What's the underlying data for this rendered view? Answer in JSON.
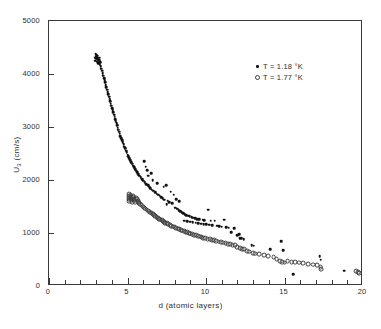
{
  "figure": {
    "background": "#ffffff",
    "frame_color": "#3a3a3a",
    "marker_filled_color": "#111111",
    "marker_open_color": "#3d3d3d"
  },
  "axes": {
    "x_title": "d (atomic layers)",
    "y_title_main": "U",
    "y_title_sub": "3",
    "y_title_unit": " (cm/s)",
    "x_ticks": [
      "0",
      "5",
      "10",
      "15",
      "20"
    ],
    "y_ticks": [
      "0",
      "1000",
      "2000",
      "3000",
      "4000",
      "5000"
    ]
  },
  "legend": {
    "items": [
      {
        "marker": "filled-dot",
        "label": "T = 1.18 °K"
      },
      {
        "marker": "open-circle",
        "label": "T = 1.77 °K"
      }
    ]
  },
  "chart_data": {
    "type": "scatter",
    "title": "",
    "xlabel": "d (atomic layers)",
    "ylabel": "U3 (cm/s)",
    "xlim": [
      0,
      20
    ],
    "ylim": [
      0,
      5000
    ],
    "xticks": [
      0,
      5,
      10,
      15,
      20
    ],
    "yticks": [
      0,
      1000,
      2000,
      3000,
      4000,
      5000
    ],
    "x_minor_tick_step": 1,
    "grid": false,
    "legend_position": "upper-right",
    "series": [
      {
        "name": "T = 1.18 °K",
        "marker": "filled-dot",
        "color": "#111111",
        "points": [
          [
            2.92,
            4310
          ],
          [
            2.95,
            4250
          ],
          [
            2.98,
            4375
          ],
          [
            3.0,
            4330
          ],
          [
            3.02,
            4290
          ],
          [
            3.04,
            4360
          ],
          [
            3.06,
            4230
          ],
          [
            3.08,
            4300
          ],
          [
            3.1,
            4345
          ],
          [
            3.12,
            4270
          ],
          [
            3.15,
            4200
          ],
          [
            3.18,
            4255
          ],
          [
            3.2,
            4310
          ],
          [
            3.23,
            4180
          ],
          [
            3.26,
            4220
          ],
          [
            3.3,
            4150
          ],
          [
            3.34,
            4100
          ],
          [
            3.38,
            4060
          ],
          [
            3.42,
            4010
          ],
          [
            3.46,
            3970
          ],
          [
            3.5,
            3920
          ],
          [
            3.54,
            3880
          ],
          [
            3.58,
            3840
          ],
          [
            3.62,
            3790
          ],
          [
            3.66,
            3750
          ],
          [
            3.7,
            3700
          ],
          [
            3.74,
            3660
          ],
          [
            3.78,
            3620
          ],
          [
            3.82,
            3570
          ],
          [
            3.86,
            3530
          ],
          [
            3.9,
            3490
          ],
          [
            3.94,
            3440
          ],
          [
            3.98,
            3400
          ],
          [
            4.02,
            3360
          ],
          [
            4.06,
            3320
          ],
          [
            4.1,
            3275
          ],
          [
            4.14,
            3235
          ],
          [
            4.18,
            3195
          ],
          [
            4.22,
            3150
          ],
          [
            4.26,
            3110
          ],
          [
            4.3,
            3070
          ],
          [
            4.34,
            3030
          ],
          [
            4.38,
            2990
          ],
          [
            4.42,
            2950
          ],
          [
            4.46,
            2910
          ],
          [
            4.5,
            2870
          ],
          [
            4.55,
            2830
          ],
          [
            4.6,
            2790
          ],
          [
            4.65,
            2750
          ],
          [
            4.7,
            2710
          ],
          [
            4.75,
            2670
          ],
          [
            4.8,
            2630
          ],
          [
            4.85,
            2595
          ],
          [
            4.9,
            2555
          ],
          [
            4.95,
            2520
          ],
          [
            5.0,
            2480
          ],
          [
            5.06,
            2445
          ],
          [
            5.12,
            2410
          ],
          [
            5.18,
            2375
          ],
          [
            5.24,
            2340
          ],
          [
            5.3,
            2305
          ],
          [
            5.36,
            2270
          ],
          [
            5.42,
            2240
          ],
          [
            5.48,
            2205
          ],
          [
            5.54,
            2175
          ],
          [
            5.6,
            2145
          ],
          [
            5.68,
            2110
          ],
          [
            5.76,
            2080
          ],
          [
            5.84,
            2050
          ],
          [
            5.92,
            2020
          ],
          [
            6.0,
            1990
          ],
          [
            6.05,
            2360
          ],
          [
            6.15,
            2250
          ],
          [
            6.25,
            2180
          ],
          [
            6.3,
            2080
          ],
          [
            6.1,
            1955
          ],
          [
            6.2,
            1925
          ],
          [
            6.3,
            1900
          ],
          [
            6.4,
            1875
          ],
          [
            6.5,
            2130
          ],
          [
            6.45,
            1845
          ],
          [
            6.55,
            1820
          ],
          [
            6.65,
            1795
          ],
          [
            6.75,
            1770
          ],
          [
            6.6,
            2000
          ],
          [
            6.85,
            1745
          ],
          [
            6.95,
            1720
          ],
          [
            7.05,
            1700
          ],
          [
            7.15,
            1680
          ],
          [
            6.9,
            1940
          ],
          [
            7.25,
            1655
          ],
          [
            7.35,
            1630
          ],
          [
            7.45,
            1900
          ],
          [
            7.55,
            1610
          ],
          [
            7.3,
            1870
          ],
          [
            7.5,
            1540
          ],
          [
            7.65,
            1585
          ],
          [
            7.75,
            1780
          ],
          [
            7.85,
            1560
          ],
          [
            7.95,
            1725
          ],
          [
            8.05,
            1480
          ],
          [
            8.15,
            1455
          ],
          [
            8.25,
            1430
          ],
          [
            8.35,
            1410
          ],
          [
            8.1,
            1640
          ],
          [
            8.45,
            1390
          ],
          [
            8.55,
            1370
          ],
          [
            8.3,
            1600
          ],
          [
            8.65,
            1355
          ],
          [
            8.75,
            1340
          ],
          [
            8.85,
            1325
          ],
          [
            8.95,
            1315
          ],
          [
            8.6,
            1235
          ],
          [
            8.8,
            1225
          ],
          [
            9.0,
            1215
          ],
          [
            9.1,
            1300
          ],
          [
            9.2,
            1290
          ],
          [
            9.3,
            1275
          ],
          [
            9.15,
            1205
          ],
          [
            9.35,
            1195
          ],
          [
            9.45,
            1265
          ],
          [
            9.55,
            1255
          ],
          [
            9.5,
            1185
          ],
          [
            9.7,
            1178
          ],
          [
            9.8,
            1250
          ],
          [
            9.9,
            1240
          ],
          [
            9.85,
            1170
          ],
          [
            10.0,
            1165
          ],
          [
            10.15,
            1440
          ],
          [
            10.3,
            1235
          ],
          [
            10.2,
            1155
          ],
          [
            10.4,
            1148
          ],
          [
            10.55,
            1230
          ],
          [
            10.7,
            1140
          ],
          [
            10.85,
            1130
          ],
          [
            11.0,
            1120
          ],
          [
            11.15,
            1250
          ],
          [
            11.3,
            1110
          ],
          [
            11.45,
            1100
          ],
          [
            11.6,
            1010
          ],
          [
            11.8,
            1090
          ],
          [
            12.0,
            960
          ],
          [
            12.1,
            975
          ],
          [
            12.15,
            905
          ],
          [
            12.25,
            900
          ],
          [
            12.4,
            880
          ],
          [
            12.9,
            770
          ],
          [
            13.05,
            760
          ],
          [
            14.1,
            690
          ],
          [
            14.8,
            845
          ],
          [
            14.9,
            680
          ],
          [
            15.55,
            225
          ],
          [
            17.25,
            560
          ],
          [
            17.3,
            500
          ],
          [
            18.8,
            290
          ]
        ]
      },
      {
        "name": "T = 1.77 °K",
        "marker": "open-circle",
        "color": "#3d3d3d",
        "points": [
          [
            5.08,
            1735
          ],
          [
            5.08,
            1700
          ],
          [
            5.08,
            1665
          ],
          [
            5.08,
            1630
          ],
          [
            5.08,
            1600
          ],
          [
            5.2,
            1715
          ],
          [
            5.22,
            1680
          ],
          [
            5.24,
            1650
          ],
          [
            5.26,
            1620
          ],
          [
            5.28,
            1590
          ],
          [
            5.35,
            1700
          ],
          [
            5.38,
            1670
          ],
          [
            5.41,
            1640
          ],
          [
            5.44,
            1610
          ],
          [
            5.47,
            1580
          ],
          [
            5.55,
            1660
          ],
          [
            5.6,
            1635
          ],
          [
            5.65,
            1610
          ],
          [
            5.7,
            1585
          ],
          [
            5.75,
            1560
          ],
          [
            5.82,
            1540
          ],
          [
            5.9,
            1520
          ],
          [
            5.98,
            1500
          ],
          [
            6.06,
            1480
          ],
          [
            6.14,
            1460
          ],
          [
            6.22,
            1440
          ],
          [
            6.3,
            1422
          ],
          [
            6.38,
            1404
          ],
          [
            6.46,
            1386
          ],
          [
            6.54,
            1368
          ],
          [
            6.62,
            1350
          ],
          [
            6.7,
            1333
          ],
          [
            6.78,
            1316
          ],
          [
            6.86,
            1300
          ],
          [
            6.94,
            1284
          ],
          [
            7.02,
            1268
          ],
          [
            7.1,
            1252
          ],
          [
            7.18,
            1237
          ],
          [
            7.26,
            1222
          ],
          [
            7.34,
            1208
          ],
          [
            7.42,
            1194
          ],
          [
            7.5,
            1180
          ],
          [
            7.6,
            1165
          ],
          [
            7.7,
            1150
          ],
          [
            7.8,
            1136
          ],
          [
            7.9,
            1122
          ],
          [
            8.0,
            1108
          ],
          [
            8.1,
            1095
          ],
          [
            8.2,
            1082
          ],
          [
            8.3,
            1069
          ],
          [
            8.4,
            1057
          ],
          [
            8.5,
            1045
          ],
          [
            8.6,
            1033
          ],
          [
            8.7,
            1021
          ],
          [
            8.8,
            1010
          ],
          [
            8.9,
            999
          ],
          [
            9.0,
            988
          ],
          [
            9.12,
            976
          ],
          [
            9.24,
            964
          ],
          [
            9.36,
            953
          ],
          [
            9.48,
            942
          ],
          [
            9.6,
            931
          ],
          [
            9.72,
            921
          ],
          [
            9.84,
            911
          ],
          [
            9.96,
            901
          ],
          [
            10.1,
            890
          ],
          [
            10.24,
            879
          ],
          [
            10.38,
            869
          ],
          [
            10.52,
            859
          ],
          [
            10.66,
            849
          ],
          [
            10.8,
            839
          ],
          [
            10.95,
            828
          ],
          [
            11.1,
            818
          ],
          [
            11.25,
            808
          ],
          [
            11.4,
            798
          ],
          [
            11.55,
            788
          ],
          [
            11.7,
            778
          ],
          [
            11.85,
            768
          ],
          [
            12.0,
            740
          ],
          [
            12.15,
            720
          ],
          [
            12.3,
            700
          ],
          [
            12.45,
            690
          ],
          [
            12.6,
            660
          ],
          [
            12.75,
            650
          ],
          [
            13.0,
            620
          ],
          [
            13.15,
            610
          ],
          [
            13.4,
            595
          ],
          [
            13.7,
            580
          ],
          [
            13.95,
            565
          ],
          [
            14.3,
            540
          ],
          [
            14.5,
            505
          ],
          [
            14.7,
            470
          ],
          [
            14.85,
            450
          ],
          [
            15.0,
            440
          ],
          [
            15.2,
            465
          ],
          [
            15.45,
            455
          ],
          [
            15.65,
            450
          ],
          [
            15.95,
            440
          ],
          [
            16.2,
            430
          ],
          [
            16.5,
            420
          ],
          [
            16.8,
            405
          ],
          [
            17.1,
            390
          ],
          [
            17.3,
            350
          ],
          [
            17.35,
            320
          ],
          [
            19.55,
            285
          ],
          [
            19.7,
            260
          ],
          [
            19.75,
            245
          ]
        ]
      }
    ]
  }
}
